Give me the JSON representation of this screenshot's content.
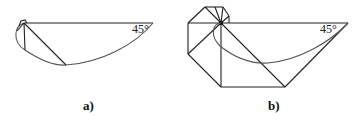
{
  "figure_a": {
    "label": "a)",
    "angle_label": "45°"
  },
  "figure_b": {
    "label": "b)",
    "angle_label": "45°"
  },
  "colors": {
    "line": "#222222",
    "arc": "#555555",
    "background": "#ffffff"
  }
}
